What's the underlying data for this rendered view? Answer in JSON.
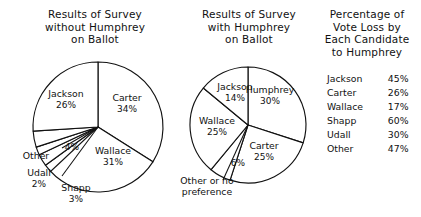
{
  "figure": {
    "background": "#ffffff",
    "ink": "#111111"
  },
  "chart_data": [
    {
      "type": "pie",
      "id": "survey-without-humphrey",
      "title": "Results of Survey without Humphrey on Ballot",
      "title_lines": [
        "Results of Survey",
        "without Humphrey",
        "on Ballot"
      ],
      "start_angle_deg": 0,
      "direction": "clockwise",
      "categories": [
        "Carter",
        "Wallace",
        "Shapp",
        "Udall",
        "Other",
        "Jackson"
      ],
      "values": [
        34,
        31,
        3,
        2,
        4,
        26
      ],
      "labels": [
        {
          "name": "Carter",
          "pct": "34%",
          "value": 34,
          "leader": false
        },
        {
          "name": "Wallace",
          "pct": "31%",
          "value": 31,
          "leader": false
        },
        {
          "name": "Shapp",
          "pct": "3%",
          "value": 3,
          "leader": true
        },
        {
          "name": "Udall",
          "pct": "2%",
          "value": 2,
          "leader": true
        },
        {
          "name": "Other",
          "pct": "4%",
          "value": 4,
          "leader": true
        },
        {
          "name": "Jackson",
          "pct": "26%",
          "value": 26,
          "leader": false
        }
      ],
      "unit": "%"
    },
    {
      "type": "pie",
      "id": "survey-with-humphrey",
      "title": "Results of Survey with Humphrey on Ballot",
      "title_lines": [
        "Results of Survey",
        "with Humphrey",
        "on Ballot"
      ],
      "start_angle_deg": 0,
      "direction": "clockwise",
      "categories": [
        "Humphrey",
        "Carter",
        "Other or no preference",
        "Wallace",
        "Jackson"
      ],
      "values": [
        30,
        25,
        6,
        25,
        14
      ],
      "labels": [
        {
          "name": "Humphrey",
          "pct": "30%",
          "value": 30,
          "leader": false
        },
        {
          "name": "Carter",
          "pct": "25%",
          "value": 25,
          "leader": false
        },
        {
          "name": "Other or no preference",
          "name_lines": [
            "Other or no",
            "preference"
          ],
          "pct": "6%",
          "value": 6,
          "leader": true
        },
        {
          "name": "Wallace",
          "pct": "25%",
          "value": 25,
          "leader": false
        },
        {
          "name": "Jackson",
          "pct": "14%",
          "value": 14,
          "leader": false
        }
      ],
      "unit": "%"
    },
    {
      "type": "table",
      "id": "vote-loss-table",
      "title": "Percentage of Vote Loss by Each Candidate to Humphrey",
      "title_lines": [
        "Percentage of",
        "Vote Loss by",
        "Each Candidate",
        "to Humphrey"
      ],
      "columns": [
        "Candidate",
        "Vote loss"
      ],
      "rows": [
        {
          "name": "Jackson",
          "pct": "45%",
          "value": 45
        },
        {
          "name": "Carter",
          "pct": "26%",
          "value": 26
        },
        {
          "name": "Wallace",
          "pct": "17%",
          "value": 17
        },
        {
          "name": "Shapp",
          "pct": "60%",
          "value": 60
        },
        {
          "name": "Udall",
          "pct": "30%",
          "value": 30
        },
        {
          "name": "Other",
          "pct": "47%",
          "value": 47
        }
      ],
      "unit": "%"
    }
  ]
}
